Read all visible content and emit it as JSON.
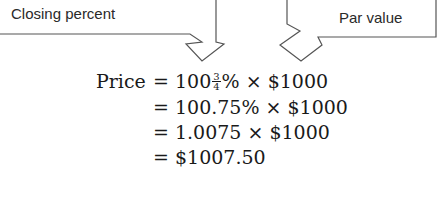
{
  "callouts": {
    "left": {
      "label": "Closing percent",
      "points_to": "100¾%"
    },
    "right": {
      "label": "Par value",
      "points_to": "$1000"
    }
  },
  "equation": {
    "lhs": "Price",
    "equals": "=",
    "lines": [
      {
        "prefix": "= 100",
        "fraction": {
          "numerator": "3",
          "denominator": "4"
        },
        "suffix": "% × $1000"
      },
      {
        "text": "= 100.75% × $1000"
      },
      {
        "text": "= 1.0075 × $1000"
      },
      {
        "text": "= $1007.50"
      }
    ]
  },
  "colors": {
    "stroke": "#555555",
    "text": "#1a1a1a",
    "background": "#ffffff"
  }
}
